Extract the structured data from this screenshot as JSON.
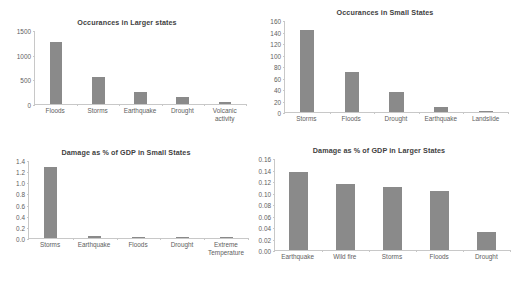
{
  "page": {
    "background_color": "#ffffff",
    "bar_color": "#8a8a8a",
    "axis_color": "#c8c8c8",
    "text_color": "#5e5e5e"
  },
  "chart_data": [
    {
      "id": "occurances-larger-states",
      "type": "bar",
      "title": "Occurances in Larger states",
      "xlabel": "",
      "ylabel": "",
      "categories": [
        "Floods",
        "Storms",
        "Earthquake",
        "Drought",
        "Volcanic activity"
      ],
      "values": [
        1250,
        540,
        250,
        145,
        50
      ],
      "yticks": [
        0,
        500,
        1000,
        1500
      ],
      "yticklabels": [
        "0",
        "500",
        "1000",
        "1500"
      ],
      "ylim": [
        0,
        1500
      ],
      "grid": false,
      "legend": false
    },
    {
      "id": "occurances-small-states",
      "type": "bar",
      "title": "Occurances in Small States",
      "xlabel": "",
      "ylabel": "",
      "categories": [
        "Storms",
        "Floods",
        "Drought",
        "Earthquake",
        "Landslide"
      ],
      "values": [
        143,
        70,
        35,
        8,
        1
      ],
      "yticks": [
        0,
        20,
        40,
        60,
        80,
        100,
        120,
        140,
        160
      ],
      "yticklabels": [
        "0",
        "20",
        "40",
        "60",
        "80",
        "100",
        "120",
        "140",
        "160"
      ],
      "ylim": [
        0,
        160
      ],
      "grid": false,
      "legend": false
    },
    {
      "id": "damage-gdp-small-states",
      "type": "bar",
      "title": "Damage as % of GDP in Small States",
      "xlabel": "",
      "ylabel": "",
      "categories": [
        "Storms",
        "Earthquake",
        "Floods",
        "Drought",
        "Extreme Temperature"
      ],
      "values": [
        1.27,
        0.03,
        0.012,
        0.002,
        0.001
      ],
      "yticks": [
        0.0,
        0.2,
        0.4,
        0.6,
        0.8,
        1.0,
        1.2,
        1.4
      ],
      "yticklabels": [
        "0.0",
        "0.2",
        "0.4",
        "0.6",
        "0.8",
        "1.0",
        "1.2",
        "1.4"
      ],
      "ylim": [
        0,
        1.4
      ],
      "grid": false,
      "legend": false
    },
    {
      "id": "damage-gdp-larger-states",
      "type": "bar",
      "title": "Damage as % of GDP in Larger States",
      "xlabel": "",
      "ylabel": "",
      "categories": [
        "Earthquake",
        "Wild fire",
        "Storms",
        "Floods",
        "Drought"
      ],
      "values": [
        0.135,
        0.115,
        0.11,
        0.103,
        0.032
      ],
      "yticks": [
        0.0,
        0.02,
        0.04,
        0.06,
        0.08,
        0.1,
        0.12,
        0.14,
        0.16
      ],
      "yticklabels": [
        "0.00",
        "0.02",
        "0.04",
        "0.06",
        "0.08",
        "0.10",
        "0.12",
        "0.14",
        "0.16"
      ],
      "ylim": [
        0,
        0.16
      ],
      "grid": false,
      "legend": false
    }
  ],
  "layout": [
    {
      "left": 8,
      "top": 18,
      "width": 238,
      "height": 118,
      "plot_height": 74,
      "y_axis_width": 26,
      "bar_width_ratio": 0.3,
      "label_lines": 2
    },
    {
      "left": 262,
      "top": 8,
      "width": 246,
      "height": 128,
      "plot_height": 92,
      "y_axis_width": 22,
      "bar_width_ratio": 0.32,
      "label_lines": 1
    },
    {
      "left": 4,
      "top": 148,
      "width": 244,
      "height": 134,
      "plot_height": 78,
      "y_axis_width": 24,
      "bar_width_ratio": 0.3,
      "label_lines": 2
    },
    {
      "left": 248,
      "top": 146,
      "width": 262,
      "height": 136,
      "plot_height": 92,
      "y_axis_width": 26,
      "bar_width_ratio": 0.42,
      "label_lines": 1
    }
  ]
}
